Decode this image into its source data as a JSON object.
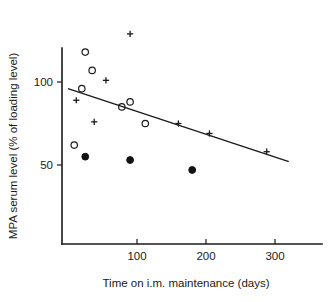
{
  "chart_data": {
    "type": "scatter",
    "title": "",
    "xlabel": "Time on i.m. maintenance (days)",
    "ylabel": "MPA serum level (% of loading level)",
    "xlim": [
      0,
      320
    ],
    "ylim": [
      0,
      120
    ],
    "xticks": [
      100,
      200,
      300
    ],
    "xtick_labels": [
      "100",
      "200",
      "300"
    ],
    "yticks": [
      50,
      100
    ],
    "ytick_labels": [
      "50",
      "100"
    ],
    "grid": false,
    "legend": "none",
    "series": [
      {
        "name": "open-circle",
        "marker": "open circle",
        "points": [
          {
            "x": 25,
            "y": 118
          },
          {
            "x": 35,
            "y": 107
          },
          {
            "x": 20,
            "y": 96
          },
          {
            "x": 9,
            "y": 62
          },
          {
            "x": 78,
            "y": 85
          },
          {
            "x": 90,
            "y": 88
          },
          {
            "x": 112,
            "y": 75
          }
        ]
      },
      {
        "name": "filled-circle",
        "marker": "filled circle",
        "points": [
          {
            "x": 25,
            "y": 55
          },
          {
            "x": 90,
            "y": 53
          },
          {
            "x": 180,
            "y": 47
          }
        ]
      },
      {
        "name": "cross",
        "marker": "plus/cross",
        "points": [
          {
            "x": 90,
            "y": 129
          },
          {
            "x": 55,
            "y": 101
          },
          {
            "x": 12,
            "y": 89
          },
          {
            "x": 38,
            "y": 76
          },
          {
            "x": 160,
            "y": 75
          },
          {
            "x": 205,
            "y": 69
          },
          {
            "x": 288,
            "y": 58
          }
        ]
      }
    ],
    "fit_line": {
      "name": "regression line",
      "x_start": 0,
      "y_start": 96,
      "x_end": 320,
      "y_end": 52
    }
  },
  "axes": {
    "y_axis_name": "y-axis",
    "x_axis_name": "x-axis"
  }
}
